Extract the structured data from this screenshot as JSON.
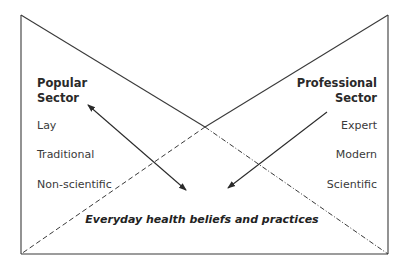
{
  "diagram": {
    "type": "health-sectors-model",
    "frame": {
      "x1": 21,
      "y1": 15,
      "x2": 388,
      "y2": 254
    },
    "crossing_point": {
      "x": 205,
      "y": 127
    },
    "colors": {
      "line": "#3a3a3a",
      "text": "#3a3a3a"
    },
    "popular_sector": {
      "title_line1": "Popular",
      "title_line2": "Sector",
      "attributes": [
        "Lay",
        "Traditional",
        "Non-scientific"
      ]
    },
    "professional_sector": {
      "title_line1": "Professional",
      "title_line2": "Sector",
      "attributes": [
        "Expert",
        "Modern",
        "Scientific"
      ]
    },
    "center_label": "Everyday health beliefs and practices",
    "arrows": [
      {
        "name": "popular-arrow",
        "from": [
          186,
          190
        ],
        "to": [
          88,
          105
        ],
        "heads": "both"
      },
      {
        "name": "professional-arrow",
        "from": [
          327,
          112
        ],
        "to": [
          228,
          188
        ],
        "heads": "end"
      }
    ],
    "line_styles": {
      "upper_diagonals": "solid",
      "lower_left_diagonal": "dashed",
      "lower_right_diagonal": "dash-dot"
    }
  }
}
